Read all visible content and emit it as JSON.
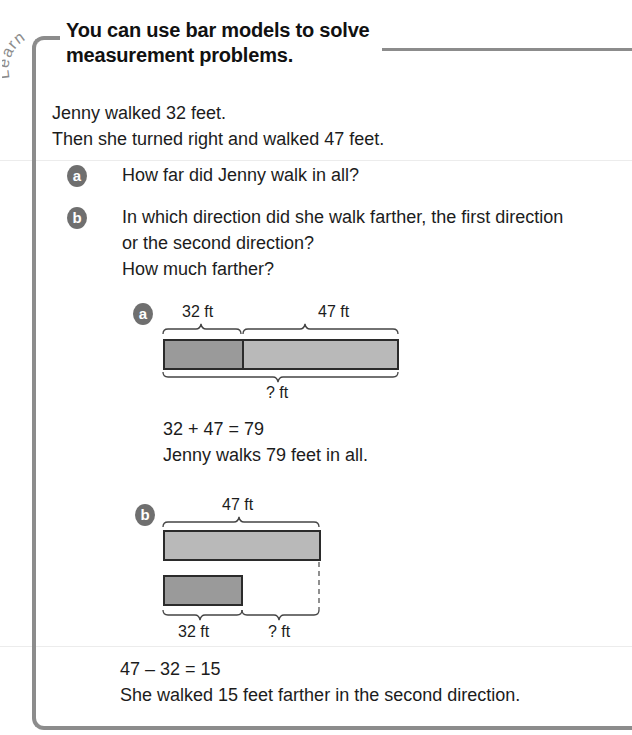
{
  "section_tag": "Learn",
  "heading": {
    "line1": "You can use bar models to solve",
    "line2": "measurement problems."
  },
  "problem": {
    "line1": "Jenny walked 32 feet.",
    "line2": "Then she turned right and walked 47 feet."
  },
  "questions": [
    {
      "badge": "a",
      "text": "How far did Jenny walk in all?"
    },
    {
      "badge": "b",
      "line1": "In which direction did she walk farther, the first direction",
      "line2": "or the second direction?",
      "line3": "How much farther?"
    }
  ],
  "model_a": {
    "badge": "a",
    "segment1_label": "32 ft",
    "segment2_label": "47 ft",
    "total_label": "? ft",
    "equation": "32 + 47 = 79",
    "answer": "Jenny walks 79 feet in all."
  },
  "model_b": {
    "badge": "b",
    "long_bar_label": "47 ft",
    "short_bar_label": "32 ft",
    "difference_label": "? ft",
    "equation": "47 – 32 = 15",
    "answer": "She walked 15 feet farther in the second direction."
  },
  "colors": {
    "frame": "#8c8c8c",
    "badge": "#6f6f6f",
    "bar_dark": "#9a9a9a",
    "bar_light": "#b9b9b9",
    "bar_border": "#2b2b2b"
  }
}
